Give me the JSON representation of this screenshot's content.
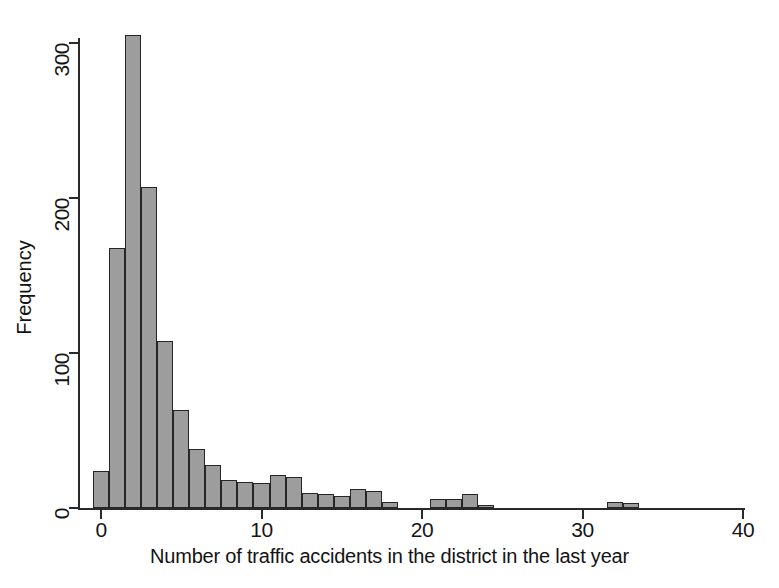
{
  "chart_data": {
    "type": "bar",
    "title": "",
    "subtitle": "",
    "xlabel": "Number of traffic accidents in the district in the last year",
    "ylabel": "Frequency",
    "xlim": [
      -1,
      40
    ],
    "ylim": [
      0,
      315
    ],
    "grid": false,
    "legend": null,
    "bin_width": 1,
    "xticks": [
      0,
      10,
      20,
      30,
      40
    ],
    "xtick_labels": [
      "0",
      "10",
      "20",
      "30",
      "40"
    ],
    "yticks": [
      0,
      100,
      200,
      300
    ],
    "ytick_labels": [
      "0",
      "100",
      "200",
      "300"
    ],
    "categories": [
      0,
      1,
      2,
      3,
      4,
      5,
      6,
      7,
      8,
      9,
      10,
      11,
      12,
      13,
      14,
      15,
      16,
      17,
      18,
      19,
      20,
      21,
      22,
      23,
      24,
      25,
      26,
      27,
      28,
      29,
      30,
      31,
      32,
      33
    ],
    "values": [
      24,
      168,
      305,
      207,
      108,
      63,
      38,
      28,
      18,
      17,
      16,
      21,
      20,
      10,
      9,
      8,
      12,
      11,
      4,
      0,
      0,
      6,
      6,
      9,
      2,
      0,
      0,
      0,
      0,
      0,
      0,
      0,
      4,
      3
    ],
    "bar_fill_color": "#9d9d9d",
    "bar_edge_color": "#262626",
    "axis_color": "#2a2a2a",
    "background_color": "#ffffff"
  }
}
